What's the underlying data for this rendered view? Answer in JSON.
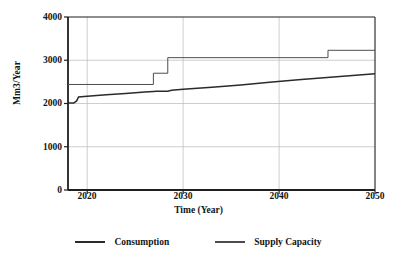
{
  "chart_data": {
    "type": "line",
    "title": "",
    "xlabel": "Time (Year)",
    "ylabel": "Mm3/Year",
    "xlim": [
      2018,
      2050
    ],
    "ylim": [
      0,
      4000
    ],
    "xticks": [
      2020,
      2030,
      2040,
      2050
    ],
    "yticks": [
      0,
      1000,
      2000,
      3000,
      4000
    ],
    "grid": true,
    "legend_position": "bottom",
    "series": [
      {
        "name": "Consumption",
        "color": "#2b2b2b",
        "style": "solid",
        "width": 1.5,
        "x": [
          2018,
          2018.6,
          2018.9,
          2019.1,
          2020,
          2022,
          2024,
          2026,
          2026.9,
          2027.2,
          2028.4,
          2028.8,
          2030,
          2033,
          2036,
          2039,
          2042,
          2045,
          2048,
          2050
        ],
        "y": [
          2010,
          2010,
          2060,
          2150,
          2170,
          2200,
          2230,
          2265,
          2280,
          2285,
          2285,
          2305,
          2330,
          2375,
          2430,
          2490,
          2550,
          2600,
          2655,
          2685
        ]
      },
      {
        "name": "Supply Capacity",
        "color": "#4d4d4d",
        "style": "solid",
        "width": 1.0,
        "x": [
          2018,
          2026.9,
          2026.9,
          2028.4,
          2028.4,
          2045.1,
          2045.1,
          2050
        ],
        "y": [
          2440,
          2440,
          2700,
          2700,
          3060,
          3060,
          3230,
          3230
        ]
      }
    ],
    "annotations": []
  },
  "legend": {
    "items": [
      {
        "label": "Consumption",
        "swatch": "consumption-line-swatch"
      },
      {
        "label": "Supply Capacity",
        "swatch": "supply-capacity-line-swatch"
      }
    ]
  },
  "colors": {
    "axis": "#1f1f1f",
    "grid": "#b9b9b9",
    "background": "#ffffff",
    "consumption": "#2b2b2b",
    "supply": "#4d4d4d"
  }
}
